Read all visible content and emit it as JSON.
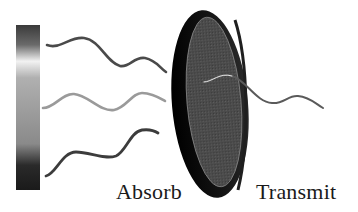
{
  "diagram": {
    "labels": {
      "absorb": "Absorb",
      "transmit": "Transmit"
    },
    "elements": {
      "spectrum_bar": {
        "gradient_stops": [
          {
            "offset": "0%",
            "color": "#3a3a3a"
          },
          {
            "offset": "12%",
            "color": "#6a6a6a"
          },
          {
            "offset": "22%",
            "color": "#f2f2f2"
          },
          {
            "offset": "32%",
            "color": "#b0b0b0"
          },
          {
            "offset": "55%",
            "color": "#9a9a9a"
          },
          {
            "offset": "72%",
            "color": "#8a8a8a"
          },
          {
            "offset": "85%",
            "color": "#2a2a2a"
          },
          {
            "offset": "100%",
            "color": "#1a1a1a"
          }
        ]
      },
      "incoming_waves": [
        {
          "name": "top-wave",
          "color": "#4a4a4a"
        },
        {
          "name": "middle-wave",
          "color": "#9a9a9a"
        },
        {
          "name": "bottom-wave",
          "color": "#3c3c3c"
        }
      ],
      "filter_disc": {
        "rim_color": "#0d0d0d",
        "face_color": "#4a4a4a"
      },
      "transmitted_wave": {
        "color": "#5a5a5a",
        "highlight": "#e0e0e0"
      }
    }
  }
}
